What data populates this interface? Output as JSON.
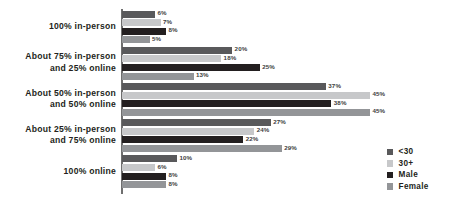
{
  "chart_data": {
    "type": "bar",
    "orientation": "horizontal",
    "title": "",
    "subtitle": "",
    "xlabel": "",
    "ylabel": "",
    "grid": false,
    "value_suffix": "%",
    "xlim": [
      0,
      45
    ],
    "legend_position": "right-bottom",
    "categories": [
      "100% in-person",
      "About 75% in-person and 25% online",
      "About 50% in-person and 50% online",
      "About 25% in-person and 75% online",
      "100% online"
    ],
    "category_lines": [
      [
        "100% in-person"
      ],
      [
        "About 75% in-person",
        "and 25% online"
      ],
      [
        "About 50% in-person",
        "and 50% online"
      ],
      [
        "About 25% in-person",
        "and 75% online"
      ],
      [
        "100% online"
      ]
    ],
    "series": [
      {
        "name": "<30",
        "color": "#59595b",
        "values": [
          6,
          20,
          37,
          27,
          10
        ],
        "labels": [
          "6%",
          "20%",
          "37%",
          "27%",
          "10%"
        ]
      },
      {
        "name": "30+",
        "color": "#c7c8ca",
        "values": [
          7,
          18,
          45,
          24,
          6
        ],
        "labels": [
          "7%",
          "18%",
          "45%",
          "24%",
          "6%"
        ]
      },
      {
        "name": "Male",
        "color": "#231f20",
        "values": [
          8,
          25,
          38,
          22,
          8
        ],
        "labels": [
          "8%",
          "25%",
          "38%",
          "22%",
          "8%"
        ]
      },
      {
        "name": "Female",
        "color": "#939598",
        "values": [
          5,
          13,
          45,
          29,
          8
        ],
        "labels": [
          "5%",
          "13%",
          "45%",
          "29%",
          "8%"
        ]
      }
    ]
  },
  "legend": {
    "items": [
      {
        "label": "<30",
        "color": "#59595b"
      },
      {
        "label": "30+",
        "color": "#c7c8ca"
      },
      {
        "label": "Male",
        "color": "#231f20"
      },
      {
        "label": "Female",
        "color": "#939598"
      }
    ]
  },
  "axis": {
    "line_color": "#6f6f6f"
  }
}
